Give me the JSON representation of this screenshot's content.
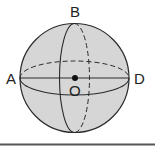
{
  "diagram": {
    "type": "sphere",
    "labels": {
      "top": "B",
      "left": "A",
      "right": "D",
      "center": "O"
    },
    "colors": {
      "fill": "#d6d6d6",
      "stroke": "#2a2a2a",
      "baseline": "#555555"
    }
  }
}
